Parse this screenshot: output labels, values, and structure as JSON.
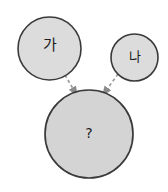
{
  "diagram": {
    "type": "concept-combination",
    "background_color": "#ffffff",
    "node_fill": "#d4d4d4",
    "node_stroke": "#3a3a3a",
    "arrow_color": "#8c8c8c",
    "text_color": "#1c1c1c",
    "nodes": [
      {
        "id": "node-ga",
        "label": "가",
        "shape": "circle",
        "cx": 49.5,
        "cy": 48.5,
        "r": 31.5,
        "size": "medium"
      },
      {
        "id": "node-na",
        "label": "나",
        "shape": "circle",
        "cx": 134.5,
        "cy": 57.5,
        "r": 23.5,
        "size": "small"
      },
      {
        "id": "node-result",
        "label": "?",
        "shape": "circle",
        "cx": 89,
        "cy": 134,
        "r": 44,
        "size": "large"
      }
    ],
    "arrows": [
      {
        "id": "arrow-ga-to-result",
        "from": "node-ga",
        "to": "node-result",
        "style": "dashed",
        "direction": "down-right",
        "x1": 62,
        "y1": 70,
        "x2": 76,
        "y2": 94
      },
      {
        "id": "arrow-na-to-result",
        "from": "node-na",
        "to": "node-result",
        "style": "dashed",
        "direction": "down-left",
        "x1": 118,
        "y1": 75,
        "x2": 104,
        "y2": 94
      }
    ]
  }
}
